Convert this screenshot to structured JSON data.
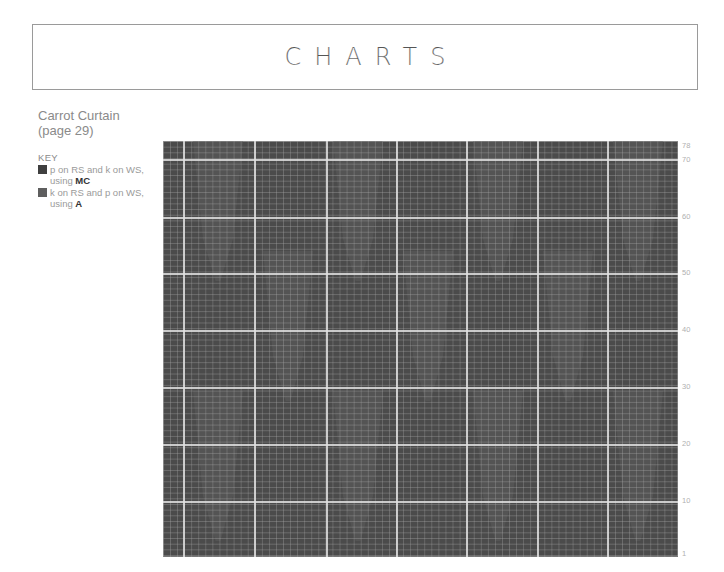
{
  "header": {
    "title": "CHARTS"
  },
  "chart_info": {
    "name": "Carrot Curtain",
    "page": "(page 29)",
    "key_label": "KEY",
    "key_items": [
      {
        "text_pre": "p on RS and k on WS, using ",
        "yarn": "MC",
        "color": "#3f3f3f"
      },
      {
        "text_pre": "k on RS and p on WS, using ",
        "yarn": "A",
        "color": "#5e5e5e"
      }
    ]
  },
  "row_labels": [
    {
      "label": "78",
      "y": 142
    },
    {
      "label": "70",
      "y": 156
    },
    {
      "label": "60",
      "y": 213
    },
    {
      "label": "50",
      "y": 269
    },
    {
      "label": "40",
      "y": 326
    },
    {
      "label": "30",
      "y": 383
    },
    {
      "label": "20",
      "y": 440
    },
    {
      "label": "10",
      "y": 497
    },
    {
      "label": "1",
      "y": 550
    }
  ],
  "chart_data": {
    "type": "heatmap",
    "title": "Carrot Curtain (page 29)",
    "xlabel": "",
    "ylabel": "Row",
    "rows": 78,
    "stitches": 73,
    "row_ticks": [
      1,
      10,
      20,
      30,
      40,
      50,
      60,
      70,
      78
    ],
    "major_grid_every": 10,
    "grid": true,
    "legend": [
      {
        "symbol": "dark square",
        "meaning": "p on RS and k on WS, using MC"
      },
      {
        "symbol": "light square",
        "meaning": "k on RS and p on WS, using A"
      }
    ],
    "colors": {
      "background": "#4b4b4b",
      "carrot_motif": "#575757",
      "grid_minor": "#8c8c8c",
      "grid_major": "#e1e1e1"
    },
    "motif_description": "Staggered tapered vertical carrot shapes in contrast yarn A on a main-colour MC background, arranged in offset tiers across the width."
  },
  "major_v_lines_px": [
    20,
    91,
    163,
    233,
    303,
    374,
    444
  ],
  "major_h_lines_px": [
    18,
    76,
    132,
    189,
    246,
    303,
    360
  ],
  "carrots": [
    {
      "left": 30,
      "top": 0,
      "width": 50,
      "height": 140
    },
    {
      "left": 170,
      "top": 0,
      "width": 50,
      "height": 140
    },
    {
      "left": 310,
      "top": 0,
      "width": 50,
      "height": 140
    },
    {
      "left": 450,
      "top": 0,
      "width": 50,
      "height": 140
    },
    {
      "left": 100,
      "top": 110,
      "width": 50,
      "height": 150
    },
    {
      "left": 240,
      "top": 110,
      "width": 50,
      "height": 150
    },
    {
      "left": 380,
      "top": 110,
      "width": 50,
      "height": 150
    },
    {
      "left": 30,
      "top": 250,
      "width": 50,
      "height": 150
    },
    {
      "left": 170,
      "top": 250,
      "width": 50,
      "height": 150
    },
    {
      "left": 310,
      "top": 250,
      "width": 50,
      "height": 150
    },
    {
      "left": 450,
      "top": 250,
      "width": 50,
      "height": 150
    }
  ]
}
